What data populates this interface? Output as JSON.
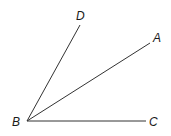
{
  "diagram": {
    "type": "angle-rays",
    "vertex": {
      "label": "B"
    },
    "rays": [
      {
        "label": "D"
      },
      {
        "label": "A"
      },
      {
        "label": "C"
      }
    ],
    "line_color": "#333333",
    "label_color": "#1a1a1a"
  }
}
